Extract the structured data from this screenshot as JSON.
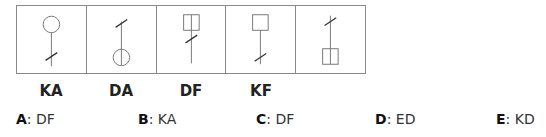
{
  "figures": [
    {
      "id": "fig1",
      "shape": "circle",
      "shape_position": "top",
      "slash_position": "bottom",
      "divided": false
    },
    {
      "id": "fig2",
      "shape": "circle",
      "shape_position": "bottom",
      "slash_position": "top",
      "divided": true
    },
    {
      "id": "fig3",
      "shape": "square",
      "shape_position": "top",
      "slash_position": "middle",
      "divided": true
    },
    {
      "id": "fig4",
      "shape": "square",
      "shape_position": "top",
      "slash_position": "bottom",
      "divided": false
    },
    {
      "id": "fig5",
      "shape": "square",
      "shape_position": "bottom",
      "slash_position": "top",
      "divided": true
    }
  ],
  "labels": [
    "KA",
    "DA",
    "DF",
    "KF"
  ],
  "options": [
    {
      "letter": "A",
      "value": "DF"
    },
    {
      "letter": "B",
      "value": "KA"
    },
    {
      "letter": "C",
      "value": "DF"
    },
    {
      "letter": "D",
      "value": "ED"
    },
    {
      "letter": "E",
      "value": "KD"
    }
  ]
}
